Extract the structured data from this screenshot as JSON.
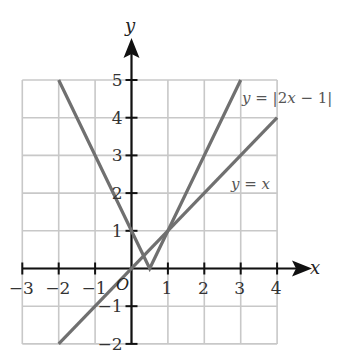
{
  "chart_data": {
    "type": "line",
    "title": "",
    "xlabel": "x",
    "ylabel": "y",
    "origin_label": "O",
    "xlim": [
      -3,
      4
    ],
    "ylim": [
      -2,
      5
    ],
    "grid": true,
    "x_ticks": [
      -3,
      -2,
      -1,
      1,
      2,
      3,
      4
    ],
    "y_ticks": [
      -2,
      -1,
      1,
      2,
      3,
      4,
      5
    ],
    "x_tick_labels": [
      "−3",
      "−2",
      "−1",
      "1",
      "2",
      "3",
      "4"
    ],
    "y_tick_labels": [
      "−2",
      "−1",
      "1",
      "2",
      "3",
      "4",
      "5"
    ],
    "series": [
      {
        "name": "y = |2x − 1|",
        "label_parts": {
          "y": "y",
          "eq": " = |2",
          "x": "x",
          "rest": " − 1|"
        },
        "points": [
          [
            -2,
            5
          ],
          [
            0.5,
            0
          ],
          [
            3,
            5
          ]
        ],
        "color": "#707070"
      },
      {
        "name": "y = x",
        "label_parts": {
          "y": "y",
          "eq": " = ",
          "x": "x"
        },
        "points": [
          [
            -2,
            -2
          ],
          [
            4,
            4
          ]
        ],
        "color": "#707070"
      }
    ],
    "colors": {
      "grid": "#c8c8c8",
      "axis": "#111111",
      "line": "#707070"
    }
  }
}
